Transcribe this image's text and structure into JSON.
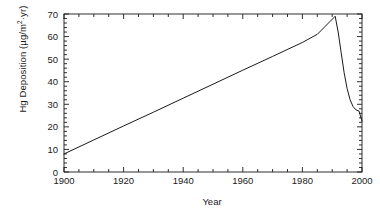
{
  "chart_data": {
    "type": "line",
    "title": "",
    "xlabel": "Year",
    "ylabel": "Hg Deposition (µg/m²·yr)",
    "ylabel_prefix": "Hg Deposition (µg/m",
    "ylabel_superscript": "2",
    "ylabel_suffix": "·yr)",
    "xlim": [
      1900,
      2000
    ],
    "ylim": [
      0,
      70
    ],
    "x_major_ticks": [
      1900,
      1920,
      1940,
      1960,
      1980,
      2000
    ],
    "x_tick_labels": [
      "1900",
      "1920",
      "1940",
      "1960",
      "1980",
      "2000"
    ],
    "x_minor_interval": 5,
    "y_major_ticks": [
      0,
      10,
      20,
      30,
      40,
      50,
      60,
      70
    ],
    "y_tick_labels": [
      "0",
      "10",
      "20",
      "30",
      "40",
      "50",
      "60",
      "70"
    ],
    "y_minor_interval": 2,
    "grid": false,
    "legend": false,
    "frame": "box",
    "tick_direction": "in",
    "line_color": "#1a1a1a",
    "line_width": 1.0,
    "series": [
      {
        "name": "Hg Deposition",
        "x": [
          1900,
          1910,
          1920,
          1930,
          1940,
          1950,
          1960,
          1970,
          1980,
          1985,
          1991,
          1992,
          1993,
          1994,
          1995,
          1996,
          1997,
          1998,
          1999,
          2000
        ],
        "y": [
          8.0,
          14.2,
          20.4,
          26.5,
          32.7,
          38.9,
          45.1,
          51.2,
          57.4,
          61.0,
          69.0,
          62.0,
          53.0,
          44.0,
          37.0,
          32.0,
          29.0,
          27.5,
          27.0,
          22.5
        ]
      }
    ],
    "annotations": []
  },
  "axes": {
    "x_axis_name": "year-axis",
    "y_axis_name": "hg-deposition-axis"
  }
}
